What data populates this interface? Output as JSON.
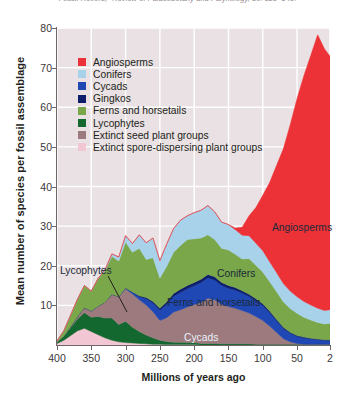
{
  "caption": {
    "text": "Fossil Record,\" Review of Palaeobotany and Palynology, 50: 129–149."
  },
  "chart_data": {
    "type": "area",
    "title": "",
    "xlabel": "Millions of years ago",
    "ylabel": "Mean number of species per fossil assemblage",
    "xlim": [
      400,
      2
    ],
    "ylim": [
      0,
      80
    ],
    "x_reversed": true,
    "grid": true,
    "legend_position": "top-left-inside",
    "background_color": "#e9e1e3",
    "gridline_color": "#ffffff",
    "xticks": [
      400,
      350,
      300,
      250,
      200,
      150,
      100,
      50,
      2
    ],
    "yticks": [
      10,
      20,
      30,
      40,
      50,
      60,
      70,
      80
    ],
    "x": [
      400,
      390,
      380,
      370,
      360,
      350,
      340,
      330,
      320,
      310,
      300,
      290,
      280,
      270,
      260,
      250,
      240,
      230,
      220,
      210,
      200,
      190,
      180,
      170,
      160,
      150,
      140,
      130,
      120,
      110,
      100,
      90,
      80,
      70,
      60,
      50,
      40,
      30,
      20,
      10,
      2
    ],
    "stack_order_bottom_to_top": [
      "Extinct spore-dispersing plant groups",
      "Lycophytes",
      "Extinct seed plant groups",
      "Cycads",
      "Gingkos",
      "Ferns and horsetails",
      "Conifers",
      "Angiosperms"
    ],
    "series": [
      {
        "name": "Extinct spore-dispersing plant groups",
        "color": "#f2c6d2",
        "values": [
          0.4,
          1.2,
          2.4,
          3.6,
          4.2,
          3.4,
          2.6,
          1.8,
          1.2,
          0.8,
          0.6,
          0.5,
          0.4,
          0.3,
          0.2,
          0.2,
          0.1,
          0.1,
          0.1,
          0.1,
          0.1,
          0,
          0,
          0,
          0,
          0,
          0,
          0,
          0,
          0,
          0,
          0,
          0,
          0,
          0,
          0,
          0,
          0,
          0,
          0,
          0
        ]
      },
      {
        "name": "Lycophytes",
        "color": "#13682f",
        "values": [
          0.3,
          1.0,
          2.0,
          3.0,
          4.0,
          3.6,
          4.6,
          5.0,
          5.6,
          4.4,
          5.4,
          4.0,
          3.0,
          2.2,
          1.6,
          1.0,
          0.8,
          0.6,
          0.6,
          0.5,
          0.5,
          0.4,
          0.4,
          0.4,
          0.3,
          0.3,
          0.3,
          0.3,
          0.3,
          0.2,
          0.2,
          0.2,
          0.2,
          0.2,
          0.2,
          0.2,
          0.2,
          0.2,
          0.2,
          0.2,
          0.2
        ]
      },
      {
        "name": "Extinct seed plant groups",
        "color": "#9c7a7e",
        "values": [
          0,
          0,
          0.2,
          0.6,
          1.2,
          1.6,
          2.6,
          4.0,
          6.0,
          7.0,
          8.2,
          8.4,
          8.0,
          7.6,
          6.6,
          5.0,
          6.0,
          7.6,
          8.2,
          9.0,
          9.6,
          10.4,
          11.4,
          11.0,
          10.0,
          9.4,
          9.0,
          8.4,
          7.8,
          7.0,
          6.0,
          4.6,
          3.0,
          1.4,
          0.6,
          0.2,
          0,
          0,
          0,
          0,
          0
        ]
      },
      {
        "name": "Cycads",
        "color": "#2048b4",
        "values": [
          0,
          0,
          0,
          0,
          0,
          0,
          0,
          0,
          0,
          0,
          0.2,
          0.4,
          0.8,
          1.6,
          2.2,
          2.6,
          3.4,
          4.0,
          4.4,
          4.6,
          4.8,
          5.0,
          5.2,
          5.0,
          4.8,
          4.6,
          4.6,
          4.4,
          4.2,
          4.0,
          3.8,
          3.4,
          3.0,
          2.6,
          2.2,
          1.8,
          1.6,
          1.4,
          1.2,
          1.0,
          1.0
        ]
      },
      {
        "name": "Gingkos",
        "color": "#0d1c6b",
        "values": [
          0,
          0,
          0,
          0,
          0,
          0,
          0,
          0,
          0,
          0,
          0,
          0.1,
          0.2,
          0.3,
          0.4,
          0.5,
          0.6,
          0.7,
          0.8,
          0.8,
          0.8,
          0.8,
          0.8,
          0.8,
          0.7,
          0.7,
          0.6,
          0.6,
          0.5,
          0.5,
          0.4,
          0.4,
          0.3,
          0.3,
          0.2,
          0.2,
          0.2,
          0.1,
          0.1,
          0.1,
          0.1
        ]
      },
      {
        "name": "Ferns and horsetails",
        "color": "#7aa74a",
        "values": [
          0.3,
          1.4,
          3.0,
          4.4,
          5.6,
          5.0,
          7.0,
          8.0,
          9.6,
          9.0,
          11.6,
          10.0,
          12.0,
          9.6,
          11.0,
          7.6,
          9.0,
          10.4,
          11.0,
          11.6,
          11.0,
          10.4,
          10.0,
          9.4,
          8.6,
          9.0,
          8.4,
          8.0,
          9.0,
          8.4,
          8.0,
          7.4,
          7.0,
          6.4,
          6.0,
          5.6,
          5.0,
          4.6,
          4.2,
          4.0,
          4.2
        ]
      },
      {
        "name": "Conifers",
        "color": "#a7d2ea",
        "values": [
          0,
          0,
          0,
          0,
          0,
          0,
          0,
          0.2,
          0.6,
          1.0,
          1.6,
          2.2,
          3.4,
          4.2,
          5.0,
          4.4,
          5.6,
          6.0,
          6.4,
          6.0,
          6.6,
          7.0,
          7.4,
          7.0,
          6.6,
          6.4,
          6.2,
          6.0,
          5.8,
          5.6,
          5.4,
          5.0,
          4.8,
          4.6,
          4.4,
          4.2,
          4.0,
          3.8,
          3.6,
          3.4,
          3.4
        ]
      },
      {
        "name": "Angiosperms",
        "color": "#ed3237",
        "values": [
          0,
          0,
          0,
          0,
          0,
          0,
          0,
          0,
          0,
          0,
          0,
          0,
          0,
          0,
          0,
          0,
          0,
          0,
          0,
          0,
          0,
          0,
          0,
          0,
          0,
          0,
          0.4,
          2.0,
          5.0,
          9.0,
          14.0,
          20.0,
          27.0,
          34.0,
          42.0,
          50.0,
          57.0,
          63.0,
          69.0,
          66.0,
          64.0
        ]
      }
    ],
    "annotations": [
      {
        "text": "Angiosperms",
        "x_px": 272,
        "y_px": 222,
        "style": "dark"
      },
      {
        "text": "Conifers",
        "x_px": 217,
        "y_px": 268,
        "style": "dark"
      },
      {
        "text": "Ferns and horsetails",
        "x_px": 167,
        "y_px": 297,
        "style": "dark"
      },
      {
        "text": "Cycads",
        "x_px": 184,
        "y_px": 332,
        "style": "light"
      },
      {
        "text": "Lycophytes",
        "x_px": 60,
        "y_px": 265,
        "style": "dark"
      }
    ]
  },
  "legend": {
    "items": [
      {
        "label": "Angiosperms",
        "color": "#ed3237"
      },
      {
        "label": "Conifers",
        "color": "#a7d2ea"
      },
      {
        "label": "Cycads",
        "color": "#2048b4"
      },
      {
        "label": "Gingkos",
        "color": "#0d1c6b"
      },
      {
        "label": "Ferns and horsetails",
        "color": "#7aa74a"
      },
      {
        "label": "Lycophytes",
        "color": "#13682f"
      },
      {
        "label": "Extinct seed plant groups",
        "color": "#9c7a7e"
      },
      {
        "label": "Extinct spore-dispersing plant groups",
        "color": "#f2c6d2"
      }
    ]
  }
}
